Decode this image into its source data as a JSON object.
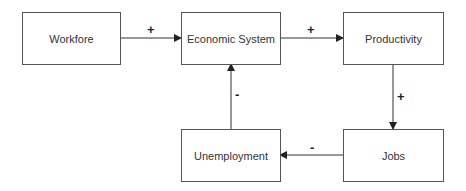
{
  "diagram": {
    "nodes": [
      {
        "id": "workforce",
        "label": "Workfore"
      },
      {
        "id": "economic_system",
        "label": "Economic System"
      },
      {
        "id": "productivity",
        "label": "Productivity"
      },
      {
        "id": "jobs",
        "label": "Jobs"
      },
      {
        "id": "unemployment",
        "label": "Unemployment"
      }
    ],
    "edges": [
      {
        "from": "workforce",
        "to": "economic_system",
        "sign": "+"
      },
      {
        "from": "economic_system",
        "to": "productivity",
        "sign": "+"
      },
      {
        "from": "productivity",
        "to": "jobs",
        "sign": "+"
      },
      {
        "from": "jobs",
        "to": "unemployment",
        "sign": "-"
      },
      {
        "from": "unemployment",
        "to": "economic_system",
        "sign": "-"
      }
    ]
  }
}
